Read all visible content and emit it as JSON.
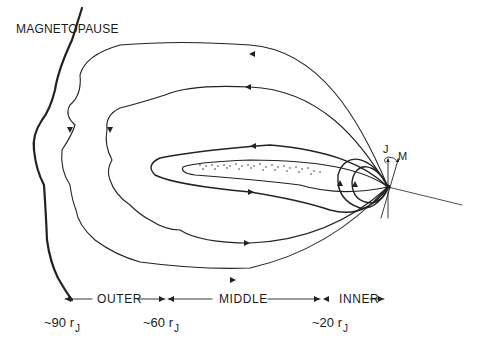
{
  "figure": {
    "type": "magnetosphere-cross-section",
    "line_color": "#222222",
    "background": "#ffffff"
  },
  "labels": {
    "boundary": "MAGNETOPAUSE",
    "spin_axis": "J",
    "magnetic_axis": "M"
  },
  "regions": [
    {
      "name": "OUTER"
    },
    {
      "name": "MIDDLE"
    },
    {
      "name": "INNER"
    }
  ],
  "distances": [
    {
      "prefix": "~90 r",
      "sub": "J"
    },
    {
      "prefix": "~60 r",
      "sub": "J"
    },
    {
      "prefix": "~20 r",
      "sub": "J"
    }
  ]
}
